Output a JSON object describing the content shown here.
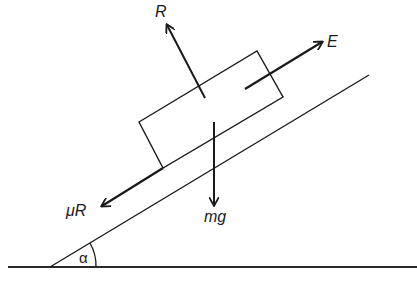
{
  "diagram": {
    "type": "free-body diagram",
    "colors": {
      "ink": "#1a1a1a",
      "background": "#ffffff"
    },
    "forces": [
      {
        "id": "normal",
        "label": "R",
        "direction": "perpendicular to incline, away from surface"
      },
      {
        "id": "applied",
        "label": "E",
        "direction": "up the incline"
      },
      {
        "id": "weight",
        "label": "mg",
        "direction": "vertically downward"
      },
      {
        "id": "friction",
        "label": "μR",
        "direction": "down the incline"
      }
    ],
    "angle": {
      "label": "α",
      "between": "incline and horizontal ground"
    }
  }
}
